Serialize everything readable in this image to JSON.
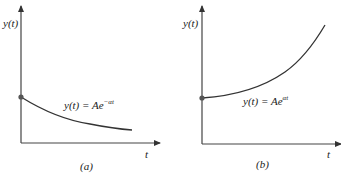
{
  "panels": [
    {
      "id": "a",
      "caption": "(a)",
      "y_label": "y(t)",
      "x_label": "t",
      "equation": {
        "lhs": "y(t) = Ae",
        "exponent": "−αt"
      },
      "curve": "decaying exponential",
      "initial_value_label": "A"
    },
    {
      "id": "b",
      "caption": "(b)",
      "y_label": "y(t)",
      "x_label": "t",
      "equation": {
        "lhs": "y(t) = Ae",
        "exponent": "αt"
      },
      "curve": "growing exponential",
      "initial_value_label": "A"
    }
  ],
  "colors": {
    "axis": "#444444",
    "curve": "#333333",
    "dot": "#555555"
  }
}
